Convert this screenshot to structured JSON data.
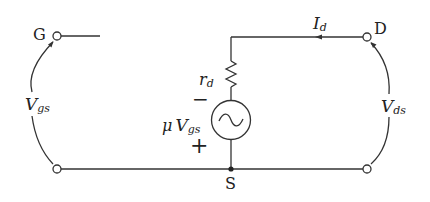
{
  "diagram": {
    "type": "circuit",
    "terminals": {
      "gate": "G",
      "drain": "D",
      "source": "S"
    },
    "labels": {
      "vgs_main": "V",
      "vgs_sub": "gs",
      "vds_main": "V",
      "vds_sub": "ds",
      "id_main": "I",
      "id_sub": "d",
      "rd_main": "r",
      "rd_sub": "d",
      "src_mu": "μ",
      "src_main": "V",
      "src_sub": "gs",
      "minus": "−",
      "plus": "+"
    },
    "components": [
      {
        "name": "drain resistance",
        "symbol": "rd",
        "kind": "resistor"
      },
      {
        "name": "controlled voltage source",
        "symbol": "μVgs",
        "kind": "ac-source"
      }
    ],
    "colors": {
      "line": "#333333",
      "text": "#222222",
      "background": "#ffffff"
    }
  }
}
